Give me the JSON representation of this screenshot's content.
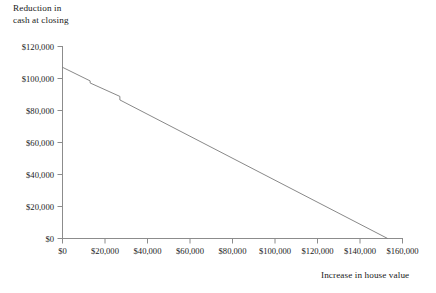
{
  "chart_data": {
    "type": "line",
    "title": "",
    "xlabel": "Increase in house value",
    "ylabel": "Reduction in\ncash at closing",
    "ylabel_line1": "Reduction in",
    "ylabel_line2": "cash at closing",
    "xlim": [
      0,
      160000
    ],
    "ylim": [
      0,
      120000
    ],
    "xticks": [
      0,
      20000,
      40000,
      60000,
      80000,
      100000,
      120000,
      140000,
      160000
    ],
    "yticks": [
      0,
      20000,
      40000,
      60000,
      80000,
      100000,
      120000
    ],
    "xticklabels": [
      "$0",
      "$20,000",
      "$40,000",
      "$60,000",
      "$80,000",
      "$100,000",
      "$120,000",
      "$140,000",
      "$160,000"
    ],
    "yticklabels": [
      "$0",
      "$20,000",
      "$40,000",
      "$60,000",
      "$80,000",
      "$100,000",
      "$120,000"
    ],
    "grid": false,
    "legend": null,
    "line_color": "#7a7a7a",
    "axis_color": "#8c8c8c",
    "series": [
      {
        "name": "Reduction in cash at closing",
        "x": [
          0,
          13000,
          13000,
          27000,
          27000,
          153000
        ],
        "values": [
          107000,
          98500,
          97200,
          88800,
          86600,
          0
        ]
      }
    ],
    "annotations": [
      {
        "note": "small downward step at approximately $13,000"
      },
      {
        "note": "small downward step at approximately $27,000"
      },
      {
        "note": "line reaches $0 at approximately $153,000"
      }
    ]
  }
}
